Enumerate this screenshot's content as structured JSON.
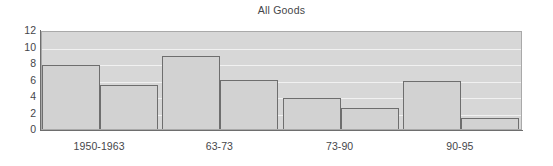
{
  "chart_data": {
    "type": "bar",
    "title": "All Goods",
    "xlabel": "",
    "ylabel": "",
    "ylim": [
      0,
      12
    ],
    "yticks": [
      0,
      2,
      4,
      6,
      8,
      10,
      12
    ],
    "grid": true,
    "legend": "none",
    "categories": [
      "1950-1963",
      "63-73",
      "73-90",
      "90-95"
    ],
    "series": [
      {
        "name": "series-1",
        "values": [
          7.8,
          8.9,
          3.7,
          5.8
        ]
      },
      {
        "name": "series-2",
        "values": [
          5.3,
          6.0,
          2.6,
          1.3
        ]
      }
    ],
    "colors": {
      "plot_background": "#d7d7d7",
      "bar_fill": "#d2d2d2",
      "bar_border": "#6e6e6e",
      "gridline": "#f1f1f1",
      "text": "#45464a",
      "page_background": "#ffffff"
    }
  }
}
